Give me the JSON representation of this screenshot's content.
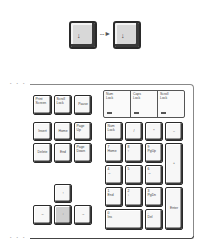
{
  "illustration": {
    "top_keys": [
      {
        "glyph": "↓",
        "name": "down-arrow-key-before"
      },
      {
        "glyph": "↓",
        "name": "down-arrow-key-after"
      }
    ],
    "transition_arrow": "- - ►"
  },
  "keyboard": {
    "frame_dots": "• • •",
    "function_row": [
      {
        "label": "Print\nScreen"
      },
      {
        "label": "Scroll\nLock"
      },
      {
        "label": "Pause"
      }
    ],
    "indicator_lights": [
      {
        "label": "Num\nLock"
      },
      {
        "label": "Caps\nLock"
      },
      {
        "label": "Scroll\nLock"
      }
    ],
    "edit_keys": [
      {
        "label": "Insert"
      },
      {
        "label": "Home"
      },
      {
        "label": "Page\nUp"
      },
      {
        "label": "Delete"
      },
      {
        "label": "End"
      },
      {
        "label": "Page\nDown"
      }
    ],
    "arrow_keys": {
      "up": "↑",
      "left": "←",
      "down": "↓",
      "right": "→",
      "highlighted": "down"
    },
    "numpad": {
      "num_lock": "Num\nLock",
      "divide": "/",
      "multiply": "*",
      "minus": "–",
      "plus": "+",
      "enter": "Enter",
      "keys": [
        {
          "main": "7",
          "sub": "Home"
        },
        {
          "main": "8",
          "sub": "↑"
        },
        {
          "main": "9",
          "sub": "PgUp"
        },
        {
          "main": "4",
          "sub": "←"
        },
        {
          "main": "5",
          "sub": ""
        },
        {
          "main": "6",
          "sub": "→"
        },
        {
          "main": "1",
          "sub": "End"
        },
        {
          "main": "2",
          "sub": "↓"
        },
        {
          "main": "3",
          "sub": "PgDn"
        },
        {
          "main": "0",
          "sub": "Ins"
        },
        {
          "main": ".",
          "sub": "Del"
        }
      ]
    }
  },
  "colors": {
    "key_outline": "#2a2a2a",
    "highlight_key": "#cfcfcf",
    "background": "#ffffff"
  }
}
